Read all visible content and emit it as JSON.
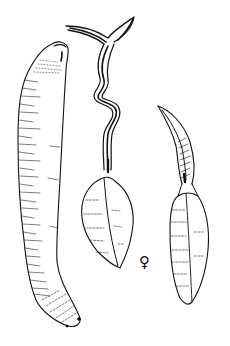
{
  "figure": {
    "type": "scientific line illustration",
    "colors": {
      "background": "#ffffff",
      "ink": "#111111"
    },
    "specimens": [
      {
        "id": "left",
        "description": "elongated cylindrical trunk with annular hatching, rounded truncated anterior end, tapered posterior"
      },
      {
        "id": "middle",
        "description": "long coiled bifurcated proboscis above an ovoid ridged trunk",
        "label": "♀"
      },
      {
        "id": "right",
        "description": "short curved hatched proboscis atop a fusiform trunk with faint transverse striations"
      }
    ]
  },
  "labels": {
    "female_symbol": "♀"
  }
}
